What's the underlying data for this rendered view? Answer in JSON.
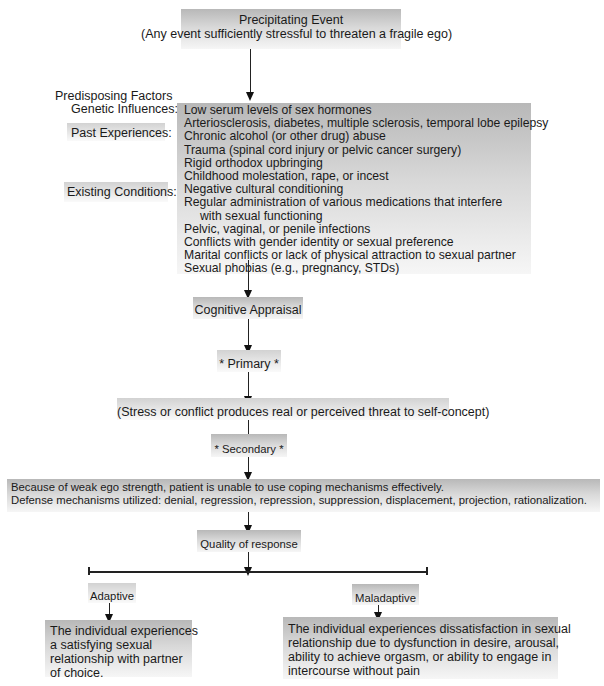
{
  "precipitating_event": {
    "title": "Precipitating Event",
    "subtitle": "(Any event sufficiently stressful to threaten a fragile ego)"
  },
  "predisposing": {
    "heading": "Predisposing Factors",
    "genetic_label": "Genetic Influences:",
    "past_label": "Past Experiences:",
    "existing_label": "Existing Conditions:",
    "items": [
      "Low serum levels of sex hormones",
      "Arteriosclerosis, diabetes, multiple sclerosis, temporal lobe epilepsy",
      "Chronic alcohol (or other drug) abuse",
      "Trauma (spinal cord injury or pelvic cancer surgery)",
      "Rigid orthodox upbringing",
      "Childhood molestation, rape, or incest",
      "Negative cultural conditioning",
      "Regular administration of various medications that interfere",
      "with sexual functioning",
      "Pelvic, vaginal, or penile infections",
      "Conflicts with gender identity or sexual preference",
      "Marital conflicts or lack of physical attraction to sexual partner",
      "Sexual phobias (e.g., pregnancy, STDs)"
    ]
  },
  "cognitive_appraisal": "Cognitive Appraisal",
  "primary": "* Primary *",
  "primary_result": "(Stress or conflict produces real or perceived threat to self-concept)",
  "secondary": "* Secondary *",
  "secondary_result": {
    "line1": "Because of weak ego strength, patient is unable to use coping mechanisms effectively.",
    "line2": "Defense mechanisms utilized: denial, regression, repression, suppression, displacement, projection, rationalization."
  },
  "quality_of_response": "Quality of response",
  "adaptive": {
    "label": "Adaptive",
    "lines": [
      "The individual experiences",
      "a satisfying sexual",
      "relationship with partner",
      "of choice."
    ]
  },
  "maladaptive": {
    "label": "Maladaptive",
    "lines": [
      "The individual experiences dissatisfaction in sexual",
      "relationship due to dysfunction in desire, arousal,",
      "ability to achieve orgasm, or ability to engage in",
      "intercourse without pain"
    ]
  },
  "colors": {
    "box_top": "#b8b8b8",
    "box_bottom": "#f6f6f6",
    "line": "#222222",
    "text": "#1a1a1a"
  }
}
